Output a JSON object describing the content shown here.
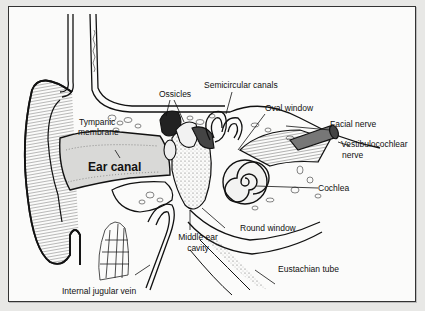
{
  "diagram": {
    "labels": {
      "ossicles": "Ossicles",
      "semicircular_canals": "Semicircular canals",
      "oval_window": "Oval window",
      "facial_nerve": "Facial nerve",
      "vestibulocochlear_line1": "Vestibulocochlear",
      "vestibulocochlear_line2": "nerve",
      "tympanic_line1": "Tympanic",
      "tympanic_line2": "membrane",
      "ear_canal": "Ear canal",
      "cochlea": "Cochlea",
      "round_window": "Round window",
      "middle_ear_line1": "Middle ear",
      "middle_ear_line2": "cavity",
      "eustachian_tube": "Eustachian tube",
      "internal_jugular_vein": "Internal jugular vein"
    },
    "colors": {
      "ink": "#111111",
      "paper": "#fbfbfa",
      "shade": "#9a9a9a"
    }
  }
}
